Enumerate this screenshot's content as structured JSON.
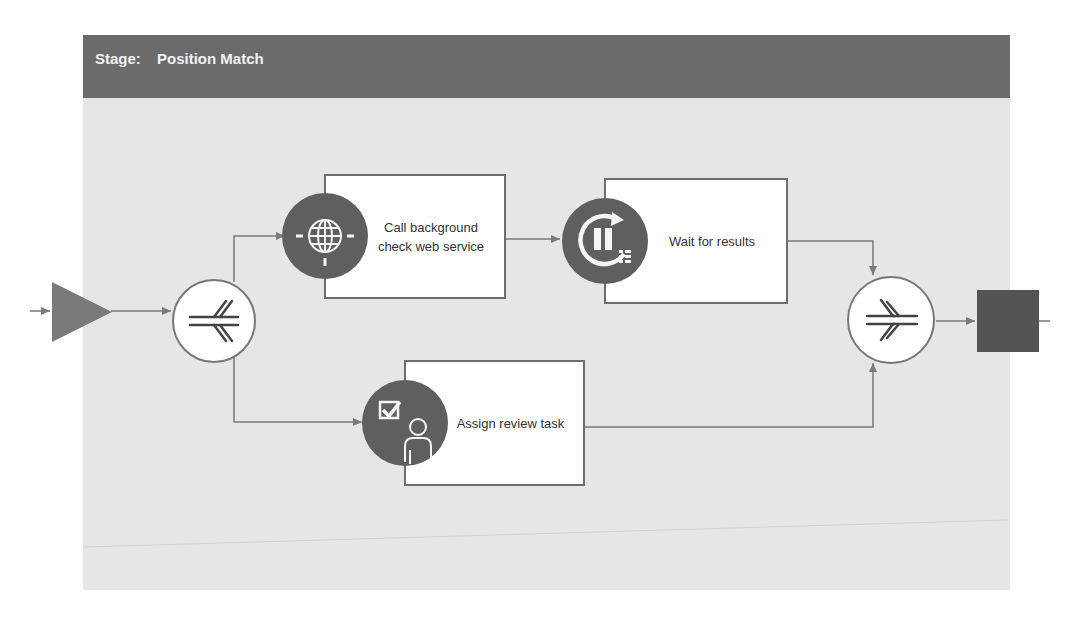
{
  "stage": {
    "label": "Stage:",
    "name": "Position Match"
  },
  "colors": {
    "header_bg": "#6b6b6b",
    "canvas_bg": "#e6e6e6",
    "icon_circle": "#5f5f5f",
    "connector": "#7a7a7a",
    "end_event": "#545454"
  },
  "nodes": {
    "start_event": {
      "type": "start-triangle"
    },
    "split_gateway": {
      "type": "parallel-split"
    },
    "task_web_service": {
      "label": "Call background check web service",
      "line1": "Call background",
      "line2": "check web service",
      "icon": "globe-icon"
    },
    "task_wait": {
      "label": "Wait for results",
      "icon": "pause-loop-icon"
    },
    "task_review": {
      "label": "Assign review task",
      "icon": "user-task-icon"
    },
    "join_gateway": {
      "type": "parallel-join"
    },
    "end_event": {
      "type": "end-square"
    }
  }
}
